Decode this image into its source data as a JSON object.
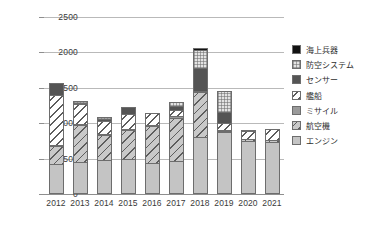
{
  "chart_data": {
    "type": "bar",
    "title": "",
    "subtitle": "",
    "xlabel": "",
    "ylabel": "",
    "stacked": true,
    "grid": true,
    "legend_position": "right",
    "ylim": [
      0,
      2500
    ],
    "yticks": [
      0,
      500,
      1000,
      1500,
      2000,
      2500
    ],
    "ytick_labels": [
      "0",
      "500",
      "1000",
      "1500",
      "2000",
      "2500"
    ],
    "categories": [
      "2012",
      "2013",
      "2014",
      "2015",
      "2016",
      "2017",
      "2018",
      "2019",
      "2020",
      "2021"
    ],
    "series": [
      {
        "name": "エンジン",
        "key": "engine",
        "swatch": "solid-light-gray",
        "values": [
          425,
          450,
          480,
          490,
          435,
          460,
          800,
          875,
          750,
          735
        ]
      },
      {
        "name": "航空機",
        "key": "aircraft",
        "swatch": "hatch-gray-diagonal",
        "values": [
          250,
          520,
          355,
          415,
          520,
          620,
          645,
          15,
          25,
          30
        ]
      },
      {
        "name": "ミサイル",
        "key": "missile",
        "swatch": "solid-medium-gray",
        "values": [
          10,
          5,
          10,
          15,
          20,
          20,
          15,
          20,
          0,
          0
        ]
      },
      {
        "name": "艦船",
        "key": "ship",
        "swatch": "hatch-white-diagonal",
        "values": [
          715,
          290,
          185,
          210,
          170,
          80,
          0,
          95,
          110,
          155
        ]
      },
      {
        "name": "センサー",
        "key": "sensor",
        "swatch": "solid-dark-gray",
        "values": [
          170,
          15,
          25,
          95,
          0,
          70,
          315,
          160,
          0,
          0
        ]
      },
      {
        "name": "防空システム",
        "key": "air-defense",
        "swatch": "checkered-light",
        "values": [
          0,
          20,
          25,
          0,
          0,
          55,
          265,
          290,
          0,
          0
        ]
      },
      {
        "name": "海上兵器",
        "key": "naval-weapon",
        "swatch": "solid-black",
        "values": [
          0,
          0,
          0,
          0,
          0,
          0,
          20,
          0,
          5,
          0
        ]
      }
    ],
    "stack_order_bottom_to_top": [
      "エンジン",
      "航空機",
      "ミサイル",
      "艦船",
      "センサー",
      "防空システム",
      "海上兵器"
    ],
    "totals": [
      1570,
      1300,
      1080,
      1225,
      1145,
      1305,
      2060,
      1455,
      890,
      920
    ]
  },
  "legend": {
    "items": [
      {
        "label": "海上兵器"
      },
      {
        "label": "防空システム"
      },
      {
        "label": "センサー"
      },
      {
        "label": "艦船"
      },
      {
        "label": "ミサイル"
      },
      {
        "label": "航空機"
      },
      {
        "label": "エンジン"
      }
    ]
  },
  "colors": {
    "gridline": "#b9b9b9",
    "axis": "#8e8e8e",
    "tick_text": "#3a3a3a",
    "legend_text": "#2e2e2e",
    "background": "#ffffff"
  }
}
